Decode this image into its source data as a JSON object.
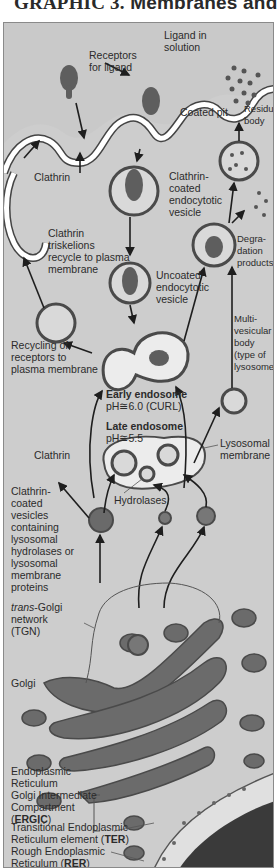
{
  "header": {
    "title_prefix": "GRAPHIC 3.",
    "title_suffix": "Membranes and"
  },
  "figure": {
    "labels": {
      "ligand_in_solution": "Ligand in\nsolution",
      "receptors_for_ligand": "Receptors\nfor ligand",
      "coated_pit": "Coated pit",
      "residual_body": "Residual\nbody",
      "clathrin_top": "Clathrin",
      "clathrin_coated_vesicle": "Clathrin-\ncoated\nendocytotic\nvesicle",
      "clathrin_triskelions": "Clathrin\ntriskelions\nrecycle to plasma\nmembrane",
      "degradation_products": "Degra-\ndation\nproducts",
      "uncoated_vesicle": "Uncoated\nendocytotic\nvesicle",
      "multivesicular_body": "Multi-\nvesicular\nbody\n(type of\nlysosome)",
      "recycling_receptors": "Recycling of\nreceptors to\nplasma membrane",
      "early_endosome_title": "Early endosome",
      "early_endosome_ph": "pH≅6.0 (CURL)",
      "late_endosome_title": "Late endosome",
      "late_endosome_ph": "pH≅5.5",
      "lysosomal_membrane": "Lysosomal\nmembrane",
      "clathrin_mid": "Clathrin",
      "hydrolases": "Hydrolases",
      "clathrin_coated_vesicles_containing": "Clathrin-\ncoated\nvesicles\ncontaining\nlysosomal\nhydrolases or\nlysosomal\nmembrane\nproteins",
      "tgn_prefix": "trans",
      "tgn_rest": "-Golgi\nnetwork\n(TGN)",
      "golgi": "Golgi",
      "ergic_text": "Endoplasmic\nReticulum\nGolgi Intermediate\nCompartment\n(",
      "ergic_abbr": "ERGIC",
      "ergic_close": ")",
      "ter_text": "Transitional Endoplasmic\nReticulum element (",
      "ter_abbr": "TER",
      "ter_close": ")",
      "rer_text": "Rough Endoplasmic\nReticulum (",
      "rer_abbr": "RER",
      "rer_close": ")"
    },
    "colors": {
      "background": "#c9c9c9",
      "extracellular": "#d4d4d4",
      "cytoplasm": "#e6e6e6",
      "organelle_fill": "#6b6b6b",
      "membrane": "#555555",
      "nucleus": "#3a3a3a",
      "text": "#2b2b2b"
    }
  }
}
